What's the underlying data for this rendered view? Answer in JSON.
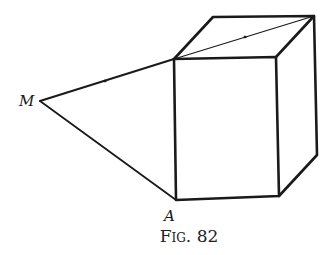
{
  "figure": {
    "caption": "Fig. 82",
    "labels": {
      "M": "M",
      "A": "A"
    },
    "points": {
      "M": [
        40,
        101
      ],
      "A": [
        176,
        200
      ],
      "front_top_left": [
        174,
        59
      ],
      "front_top_right": [
        276,
        57
      ],
      "front_bottom_right": [
        279,
        196
      ],
      "back_top_left": [
        213,
        17
      ],
      "back_top_right": [
        314,
        16
      ],
      "back_bottom_right": [
        317,
        155
      ]
    },
    "line_color": "#1a1a1a"
  }
}
